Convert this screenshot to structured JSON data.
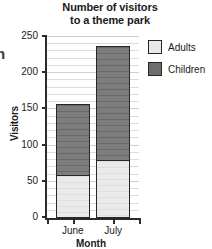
{
  "edge_fragment": "n",
  "chart_data": {
    "type": "bar",
    "subtype": "stacked-bar",
    "title": "Number of visitors to a theme park",
    "title_lines": [
      "Number of visitors",
      "to a theme park"
    ],
    "xlabel": "Month",
    "ylabel": "Visitors",
    "categories": [
      "June",
      "July"
    ],
    "series": [
      {
        "name": "Adults",
        "color": "#e8e8e8",
        "values": [
          60,
          80
        ]
      },
      {
        "name": "Children",
        "color": "#6e6e6e",
        "values": [
          100,
          160
        ]
      }
    ],
    "totals": [
      160,
      240
    ],
    "ylim": [
      0,
      250
    ],
    "ytick_values": [
      0,
      50,
      100,
      150,
      200,
      250
    ],
    "ytick_labels": [
      "0",
      "50",
      "100",
      "150",
      "200",
      "250"
    ],
    "minor_tick_step": 10,
    "grid": true,
    "legend_position": "right",
    "legend": [
      {
        "label": "Adults",
        "color": "#e8e8e8"
      },
      {
        "label": "Children",
        "color": "#6e6e6e"
      }
    ]
  }
}
